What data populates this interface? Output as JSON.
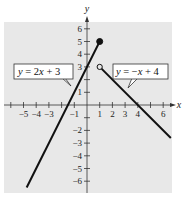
{
  "chart_data": {
    "type": "line",
    "title": "",
    "xlabel": "x",
    "ylabel": "y",
    "xlim": [
      -6,
      6.7
    ],
    "ylim": [
      -6.8,
      6.3
    ],
    "grid": false,
    "background": "#e8e8e8",
    "x_ticks": [
      -6,
      -5,
      -4,
      -3,
      -2,
      -1,
      1,
      2,
      3,
      4,
      5,
      6
    ],
    "x_tick_labels": [
      "-5",
      "-4",
      "-3",
      "-1",
      "1",
      "2",
      "3",
      "4",
      "6"
    ],
    "x_tick_label_values": [
      -5,
      -4,
      -3,
      -1,
      1,
      2,
      3,
      4,
      6
    ],
    "y_ticks": [
      -6,
      -5,
      -4,
      -3,
      -2,
      -1,
      1,
      2,
      3,
      4,
      5,
      6
    ],
    "y_tick_labels": [
      "-6",
      "-5",
      "-4",
      "-3",
      "-2",
      "1",
      "3",
      "4",
      "5",
      "6"
    ],
    "y_tick_label_values": [
      -6,
      -5,
      -4,
      -3,
      -2,
      1,
      3,
      4,
      5,
      6
    ],
    "series": [
      {
        "name": "y = 2x + 3",
        "equation": "y = 2x + 3",
        "domain": "x <= 1",
        "x": [
          -4.75,
          1
        ],
        "y": [
          -6.5,
          5
        ],
        "endpoint": {
          "x": 1,
          "y": 5,
          "style": "closed"
        }
      },
      {
        "name": "y = -x + 4",
        "equation": "y = -x + 4",
        "domain": "x > 1",
        "x": [
          1,
          6.6
        ],
        "y": [
          3,
          -2.6
        ],
        "endpoint": {
          "x": 1,
          "y": 3,
          "style": "open"
        }
      }
    ],
    "annotations": [
      {
        "text": "y = 2x + 3",
        "points_to": "left line"
      },
      {
        "text": "y = −x + 4",
        "points_to": "right line"
      }
    ]
  },
  "labels": {
    "x_axis": "x",
    "y_axis": "y",
    "callout_left": {
      "pre": "y",
      "mid": " = 2",
      "var": "x",
      "post": " + 3"
    },
    "callout_right": {
      "pre": "y",
      "mid": " = −",
      "var": "x",
      "post": " + 4"
    }
  }
}
